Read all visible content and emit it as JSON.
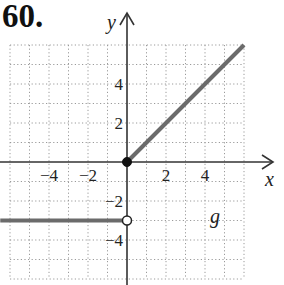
{
  "problem": {
    "number": "60."
  },
  "chart_data": {
    "type": "line",
    "title": "",
    "function_label": "g",
    "xlabel": "x",
    "ylabel": "y",
    "xlim": [
      -6,
      6
    ],
    "ylim": [
      -6,
      6
    ],
    "grid": true,
    "grid_style": "dotted",
    "x_ticks": [
      {
        "value": -4,
        "label": "−4"
      },
      {
        "value": -2,
        "label": "−2"
      },
      {
        "value": 2,
        "label": "2"
      },
      {
        "value": 4,
        "label": "4"
      }
    ],
    "y_ticks": [
      {
        "value": 4,
        "label": "4"
      },
      {
        "value": 2,
        "label": "2"
      },
      {
        "value": -2,
        "label": "−2"
      },
      {
        "value": -4,
        "label": "−4"
      }
    ],
    "series": [
      {
        "name": "g (x < 0)",
        "points": [
          [
            -6.5,
            -3
          ],
          [
            0,
            -3
          ]
        ],
        "end_marker": {
          "x": 0,
          "y": -3,
          "type": "open"
        }
      },
      {
        "name": "g (x >= 0)",
        "points": [
          [
            0,
            0
          ],
          [
            6,
            6
          ]
        ],
        "start_marker": {
          "x": 0,
          "y": 0,
          "type": "closed"
        }
      }
    ],
    "colors": {
      "curve": "#6b6b6b",
      "axis": "#333333",
      "grid": "#9a9a9a"
    }
  }
}
